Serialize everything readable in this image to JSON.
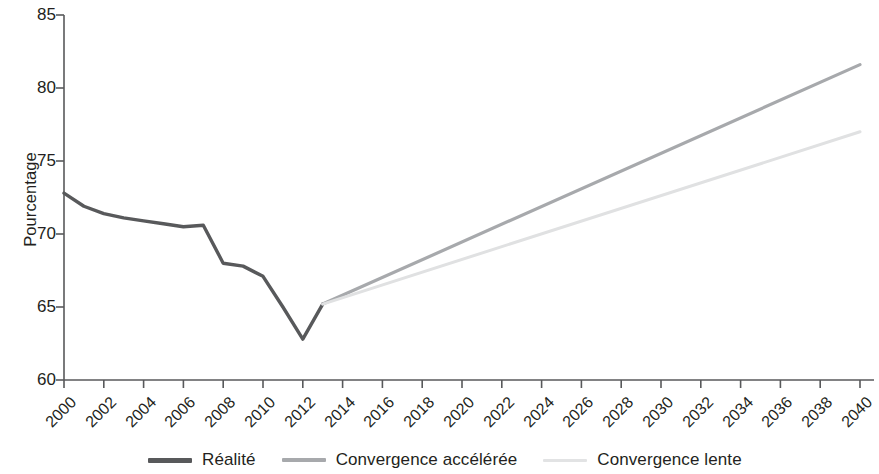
{
  "chart_data": {
    "type": "line",
    "title": "",
    "subtitle": "",
    "xlabel": "",
    "ylabel": "Pourcentage",
    "ylim": [
      60,
      85
    ],
    "ytick_values": [
      60,
      65,
      70,
      75,
      80,
      85
    ],
    "ytick_labels": [
      "60",
      "65",
      "70",
      "75",
      "80",
      "85"
    ],
    "xlim": [
      2000,
      2040
    ],
    "xtick_values": [
      2000,
      2002,
      2004,
      2006,
      2008,
      2010,
      2012,
      2014,
      2016,
      2018,
      2020,
      2022,
      2024,
      2026,
      2028,
      2030,
      2032,
      2034,
      2036,
      2038,
      2040
    ],
    "xtick_labels": [
      "2000",
      "2002",
      "2004",
      "2006",
      "2008",
      "2010",
      "2012",
      "2014",
      "2016",
      "2018",
      "2020",
      "2022",
      "2024",
      "2026",
      "2028",
      "2030",
      "2032",
      "2034",
      "2036",
      "2038",
      "2040"
    ],
    "grid": false,
    "legend_position": "bottom",
    "series": [
      {
        "name": "Réalité",
        "color": "#58595b",
        "width": 3.4,
        "x": [
          2000,
          2001,
          2002,
          2003,
          2004,
          2005,
          2006,
          2007,
          2008,
          2009,
          2010,
          2011,
          2012,
          2013
        ],
        "values": [
          72.8,
          71.9,
          71.4,
          71.1,
          70.9,
          70.7,
          70.5,
          70.6,
          68.0,
          67.8,
          67.1,
          65.0,
          62.8,
          65.2
        ]
      },
      {
        "name": "Convergence accélérée",
        "color": "#a7a9ac",
        "width": 3.2,
        "x": [
          2013,
          2040
        ],
        "values": [
          65.2,
          81.6
        ]
      },
      {
        "name": "Convergence lente",
        "color": "#e0e1e2",
        "width": 3.0,
        "x": [
          2013,
          2040
        ],
        "values": [
          65.2,
          77.0
        ]
      }
    ],
    "annotations": []
  },
  "axes": {
    "y_axis_label": "Pourcentage",
    "axis_color": "#58595b"
  },
  "legend": {
    "items": [
      {
        "label": "Réalité",
        "color": "#58595b",
        "swatch": "line-swatch-thick"
      },
      {
        "label": "Convergence accélérée",
        "color": "#a7a9ac",
        "swatch": "line-swatch-medium"
      },
      {
        "label": "Convergence lente",
        "color": "#e2e3e4",
        "swatch": "line-swatch-light"
      }
    ]
  }
}
